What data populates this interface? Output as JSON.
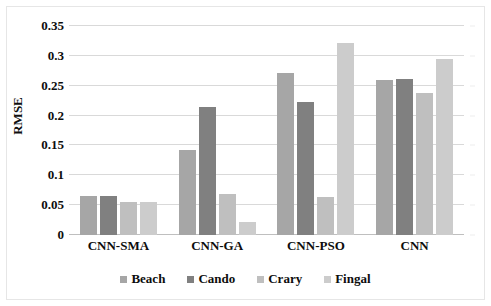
{
  "chart_data": {
    "type": "bar",
    "title": "",
    "xlabel": "",
    "ylabel": "RMSE",
    "ylim": [
      0,
      0.35
    ],
    "grid": true,
    "legend_position": "bottom",
    "categories": [
      "CNN-SMA",
      "CNN-GA",
      "CNN-PSO",
      "CNN"
    ],
    "ytick_labels": [
      "0",
      "0.05",
      "0.1",
      "0.15",
      "0.2",
      "0.25",
      "0.3",
      "0.35"
    ],
    "ytick_values": [
      0,
      0.05,
      0.1,
      0.15,
      0.2,
      0.25,
      0.3,
      0.35
    ],
    "series": [
      {
        "name": "Beach",
        "color": "#a6a6a6",
        "values": [
          0.065,
          0.143,
          0.271,
          0.26
        ]
      },
      {
        "name": "Cando",
        "color": "#808080",
        "values": [
          0.066,
          0.214,
          0.222,
          0.261
        ]
      },
      {
        "name": "Crary",
        "color": "#bfbfbf",
        "values": [
          0.055,
          0.068,
          0.063,
          0.237
        ]
      },
      {
        "name": "Fingal",
        "color": "#cccccc",
        "values": [
          0.055,
          0.021,
          0.322,
          0.295
        ]
      }
    ]
  }
}
